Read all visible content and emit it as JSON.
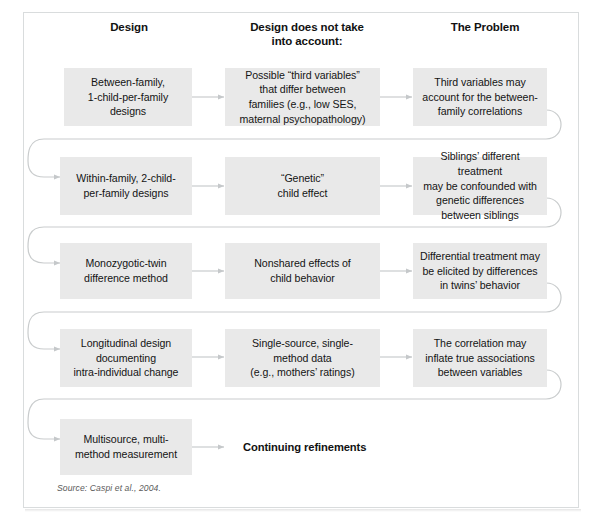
{
  "figure": {
    "top_sliver_text": "",
    "source_note": "Source: Caspi et al., 2004.",
    "colors": {
      "box_fill": "#e9e9e9",
      "frame_border": "#d9dcdd",
      "connector": "#c3c6c8",
      "arrow": "#c9cccd",
      "text": "#141414",
      "page_background": "#ffffff"
    },
    "columns": [
      {
        "id": "design",
        "label": "Design"
      },
      {
        "id": "not-accounted",
        "label": "Design does not take\ninto account:"
      },
      {
        "id": "problem",
        "label": "The Problem"
      }
    ],
    "rows": [
      {
        "id": "row-1",
        "design": "Between-family,\n1-child-per-family\ndesigns",
        "not_accounted": "Possible “third variables”\nthat differ between\nfamilies (e.g., low SES,\nmaternal psychopathology)",
        "problem": "Third variables may\naccount for the between-\nfamily correlations"
      },
      {
        "id": "row-2",
        "design": "Within-family, 2-child-\nper-family designs",
        "not_accounted": "“Genetic”\nchild effect",
        "problem": "Siblings’ different treatment\nmay be confounded with\ngenetic differences\nbetween siblings"
      },
      {
        "id": "row-3",
        "design": "Monozygotic-twin\ndifference method",
        "not_accounted": "Nonshared effects of\nchild behavior",
        "problem": "Differential treatment may\nbe elicited by differences\nin twins’ behavior"
      },
      {
        "id": "row-4",
        "design": "Longitudinal design\ndocumenting\nintra-individual change",
        "not_accounted": "Single-source, single-\nmethod data\n(e.g., mothers’ ratings)",
        "problem": "The correlation may\ninflate true associations\nbetween variables"
      },
      {
        "id": "row-5",
        "design": "Multisource, multi-\nmethod measurement",
        "not_accounted": "Continuing refinements",
        "problem": ""
      }
    ]
  }
}
